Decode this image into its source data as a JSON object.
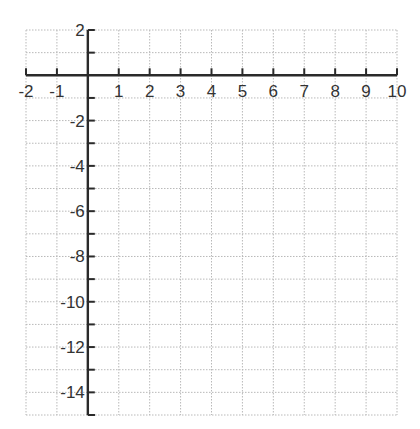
{
  "chart_data": {
    "type": "scatter",
    "title": "",
    "xlabel": "",
    "ylabel": "",
    "xlim": [
      -2,
      10
    ],
    "ylim": [
      -15,
      2
    ],
    "grid": true,
    "grid_step_x": 1,
    "grid_step_y": 1,
    "x_ticks": [
      -2,
      -1,
      1,
      2,
      3,
      4,
      5,
      6,
      7,
      8,
      9,
      10
    ],
    "x_tick_labels": [
      "-2",
      "-1",
      "1",
      "2",
      "3",
      "4",
      "5",
      "6",
      "7",
      "8",
      "9",
      "10"
    ],
    "y_ticks": [
      2,
      -2,
      -4,
      -6,
      -8,
      -10,
      -12,
      -14
    ],
    "y_tick_labels": [
      "2",
      "-2",
      "-4",
      "-6",
      "-8",
      "-10",
      "-12",
      "-14"
    ],
    "series": [],
    "colors": {
      "grid": "#b9b9b9",
      "axis": "#2a2a2a",
      "label": "#333333"
    }
  }
}
